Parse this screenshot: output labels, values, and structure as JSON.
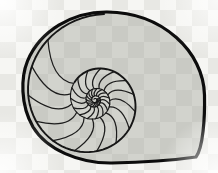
{
  "figure": {
    "style": "line engraving"
  },
  "colors": {
    "page_bg": "#fbfbfa",
    "checker_light": "#f6f6f3",
    "checker_dark": "#e8e8e4",
    "shell_fill": "rgba(148,150,138,0.36)",
    "line_outline": "#0c0c0c",
    "line_spiral": "#161616",
    "line_septa": "#1d1d1d",
    "vignette": "#ffffff"
  },
  "canvas": {
    "width": 218,
    "height": 173,
    "checker_size": 16,
    "checker_offset_x": 0,
    "checker_offset_y": -6
  },
  "shell": {
    "center": {
      "x": 95,
      "y": 100
    },
    "outline_path": "M196,157 C203,148 205,118 204.5,95 C203.5,52 163,12.5 107,12 C72,11.8 40,31 27.5,61 C21,77 20,104 33,127 C46.5,149.5 79,163.5 112,163 C143,162.5 172,160.5 196,157 Z",
    "outline_width": 3.2,
    "spiral": {
      "r0": 86.5,
      "theta0_deg": -84,
      "k": 0.16,
      "theta_min_deg": -1700,
      "r_min": 1.3,
      "step_deg": -5,
      "width_outer": 1.9,
      "width_inner": 1.1,
      "width_split_deg": -500
    },
    "septa": {
      "theta_start_deg": -128,
      "step_deg": -24,
      "min_outer_r": 5.2,
      "inner_sweep_deg": -14,
      "inner_turn_deg": -360,
      "ctrl_sweep_deg": -28,
      "ctrl_radius_factor": 0.93,
      "width": 1.25
    }
  }
}
